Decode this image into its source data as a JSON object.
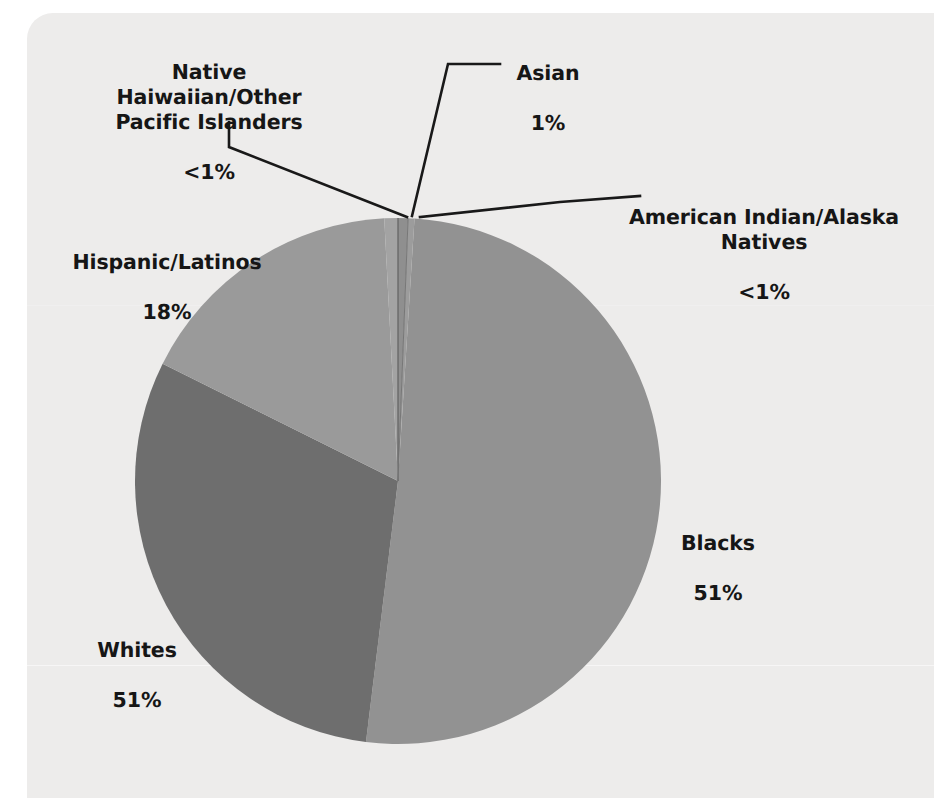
{
  "chart_data": {
    "type": "pie",
    "title": "",
    "subtitle": "",
    "xlabel": "",
    "ylabel": "",
    "legend_position": "none",
    "grid": false,
    "labels_show_value": true,
    "categories": [
      "Asian",
      "American Indian/Alaska Natives",
      "Blacks",
      "Whites",
      "Hispanic/Latinos",
      "Native Haiwaiian/Other Pacific Islanders"
    ],
    "values": [
      1,
      0.5,
      51,
      30,
      18,
      0.4
    ],
    "value_labels": [
      "1%",
      "<1%",
      "51%",
      "51%",
      "18%",
      "<1%"
    ],
    "slices": [
      {
        "name": "Asian",
        "value_label": "1%",
        "value": 1,
        "color": "#8f8f8f",
        "start_deg": 0.0,
        "end_deg": 2.2,
        "leader": true
      },
      {
        "name": "American Indian/Alaska Natives",
        "value_label": "<1%",
        "value": 0.5,
        "color": "#9c9c9c",
        "start_deg": 2.2,
        "end_deg": 3.6,
        "leader": true
      },
      {
        "name": "Blacks",
        "value_label": "51%",
        "value": 51,
        "color": "#929292",
        "start_deg": 3.6,
        "end_deg": 187.0,
        "leader": false
      },
      {
        "name": "Whites",
        "value_label": "51%",
        "value": 30,
        "color": "#6e6e6e",
        "start_deg": 187.0,
        "end_deg": 296.5,
        "leader": false
      },
      {
        "name": "Hispanic/Latinos",
        "value_label": "18%",
        "value": 18,
        "color": "#9a9a9a",
        "start_deg": 296.5,
        "end_deg": 357.0,
        "leader": false
      },
      {
        "name": "Native Haiwaiian/Other Pacific Islanders",
        "value_label": "<1%",
        "value": 0.4,
        "color": "#a3a3a3",
        "start_deg": 357.0,
        "end_deg": 360.0,
        "leader": true
      }
    ],
    "colors": {
      "blacks": "#929292",
      "whites": "#6e6e6e",
      "hispanic": "#9a9a9a",
      "asian": "#8f8f8f",
      "american_indian": "#9c9c9c",
      "native_hawaiian": "#a3a3a3",
      "leader_line": "#191919",
      "label_text": "#161616",
      "panel_background": "#edeceb",
      "page_background": "#ffffff"
    }
  },
  "labels": {
    "native_hawaiian": {
      "name": "Native Haiwaiian/Other\nPacific Islanders",
      "value": "<1%"
    },
    "asian": {
      "name": "Asian",
      "value": "1%"
    },
    "american_indian": {
      "name": "American Indian/Alaska\nNatives",
      "value": "<1%"
    },
    "hispanic": {
      "name": "Hispanic/Latinos",
      "value": "18%"
    },
    "blacks": {
      "name": "Blacks",
      "value": "51%"
    },
    "whites": {
      "name": "Whites",
      "value": "51%"
    }
  }
}
